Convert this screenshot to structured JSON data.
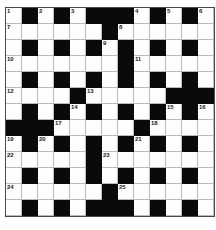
{
  "puzzle": {
    "type": "crossword-grid",
    "rows": 13,
    "columns": 13,
    "cell_size_px": 16,
    "colors": {
      "block": "#0a0a0a",
      "open": "#fdfdfd",
      "grid_line": "#b9b9b9",
      "frame": "#4a4a4a",
      "number_text": "#1a1a1a"
    },
    "legend": {
      "1": "open/white square (letter cell)",
      "0": "blocked/black square"
    },
    "grid": [
      [
        1,
        0,
        1,
        0,
        1,
        0,
        0,
        0,
        1,
        0,
        1,
        0,
        1
      ],
      [
        1,
        1,
        1,
        1,
        1,
        1,
        0,
        1,
        1,
        1,
        1,
        1,
        1
      ],
      [
        1,
        0,
        1,
        0,
        1,
        0,
        1,
        0,
        1,
        0,
        1,
        0,
        1
      ],
      [
        1,
        1,
        1,
        1,
        1,
        1,
        1,
        0,
        1,
        1,
        1,
        1,
        1
      ],
      [
        1,
        0,
        1,
        0,
        1,
        0,
        1,
        0,
        1,
        0,
        1,
        0,
        1
      ],
      [
        1,
        1,
        1,
        1,
        0,
        1,
        1,
        1,
        1,
        1,
        0,
        0,
        0
      ],
      [
        1,
        0,
        1,
        0,
        1,
        0,
        1,
        0,
        1,
        0,
        1,
        0,
        1
      ],
      [
        0,
        0,
        0,
        1,
        1,
        1,
        1,
        1,
        0,
        1,
        1,
        1,
        1
      ],
      [
        1,
        0,
        1,
        0,
        1,
        0,
        1,
        0,
        1,
        0,
        1,
        0,
        1
      ],
      [
        1,
        1,
        1,
        1,
        1,
        0,
        1,
        1,
        1,
        1,
        1,
        1,
        1
      ],
      [
        1,
        0,
        1,
        0,
        1,
        0,
        1,
        0,
        1,
        0,
        1,
        0,
        1
      ],
      [
        1,
        1,
        1,
        1,
        1,
        1,
        0,
        1,
        1,
        1,
        1,
        1,
        1
      ],
      [
        1,
        0,
        1,
        0,
        1,
        0,
        0,
        0,
        1,
        0,
        1,
        0,
        1
      ]
    ],
    "numbers": [
      {
        "n": "1",
        "row": 1,
        "col": 1
      },
      {
        "n": "2",
        "row": 1,
        "col": 3
      },
      {
        "n": "3",
        "row": 1,
        "col": 5
      },
      {
        "n": "4",
        "row": 1,
        "col": 9
      },
      {
        "n": "5",
        "row": 1,
        "col": 11
      },
      {
        "n": "6",
        "row": 1,
        "col": 13
      },
      {
        "n": "7",
        "row": 2,
        "col": 1
      },
      {
        "n": "8",
        "row": 2,
        "col": 8
      },
      {
        "n": "9",
        "row": 3,
        "col": 7
      },
      {
        "n": "10",
        "row": 4,
        "col": 1
      },
      {
        "n": "11",
        "row": 4,
        "col": 9
      },
      {
        "n": "12",
        "row": 6,
        "col": 1
      },
      {
        "n": "13",
        "row": 6,
        "col": 6
      },
      {
        "n": "14",
        "row": 7,
        "col": 5
      },
      {
        "n": "15",
        "row": 7,
        "col": 11
      },
      {
        "n": "16",
        "row": 7,
        "col": 13
      },
      {
        "n": "17",
        "row": 8,
        "col": 4
      },
      {
        "n": "18",
        "row": 8,
        "col": 10
      },
      {
        "n": "19",
        "row": 9,
        "col": 1
      },
      {
        "n": "20",
        "row": 9,
        "col": 3
      },
      {
        "n": "21",
        "row": 9,
        "col": 9
      },
      {
        "n": "22",
        "row": 10,
        "col": 1
      },
      {
        "n": "23",
        "row": 10,
        "col": 7
      },
      {
        "n": "24",
        "row": 12,
        "col": 1
      },
      {
        "n": "25",
        "row": 12,
        "col": 8
      }
    ]
  }
}
